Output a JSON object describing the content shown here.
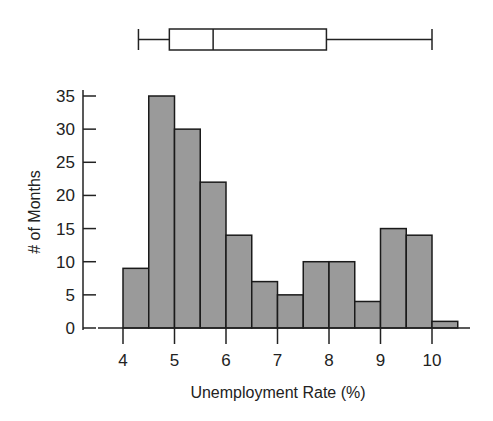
{
  "chart_data": {
    "type": "bar",
    "subtype": "histogram_with_boxplot",
    "title": "",
    "xlabel": "Unemployment Rate (%)",
    "ylabel": "# of Months",
    "bin_width": 0.5,
    "bins": [
      {
        "start": 4.0,
        "end": 4.5,
        "count": 9
      },
      {
        "start": 4.5,
        "end": 5.0,
        "count": 35
      },
      {
        "start": 5.0,
        "end": 5.5,
        "count": 30
      },
      {
        "start": 5.5,
        "end": 6.0,
        "count": 22
      },
      {
        "start": 6.0,
        "end": 6.5,
        "count": 14
      },
      {
        "start": 6.5,
        "end": 7.0,
        "count": 7
      },
      {
        "start": 7.0,
        "end": 7.5,
        "count": 5
      },
      {
        "start": 7.5,
        "end": 8.0,
        "count": 10
      },
      {
        "start": 8.0,
        "end": 8.5,
        "count": 10
      },
      {
        "start": 8.5,
        "end": 9.0,
        "count": 4
      },
      {
        "start": 9.0,
        "end": 9.5,
        "count": 15
      },
      {
        "start": 9.5,
        "end": 10.0,
        "count": 14
      },
      {
        "start": 10.0,
        "end": 10.5,
        "count": 1
      }
    ],
    "categories": [
      "4.0-4.5",
      "4.5-5.0",
      "5.0-5.5",
      "5.5-6.0",
      "6.0-6.5",
      "6.5-7.0",
      "7.0-7.5",
      "7.5-8.0",
      "8.0-8.5",
      "8.5-9.0",
      "9.0-9.5",
      "9.5-10.0",
      "10.0-10.5"
    ],
    "values": [
      9,
      35,
      30,
      22,
      14,
      7,
      5,
      10,
      10,
      4,
      15,
      14,
      1
    ],
    "xticks": [
      4,
      5,
      6,
      7,
      8,
      9,
      10
    ],
    "yticks": [
      0,
      5,
      10,
      15,
      20,
      25,
      30,
      35
    ],
    "xlim": [
      3.5,
      10.8
    ],
    "ylim": [
      0,
      35
    ],
    "grid": false,
    "legend": null,
    "boxplot": {
      "min": 4.3,
      "q1": 4.9,
      "median": 5.75,
      "q3": 7.95,
      "max": 10.0
    },
    "colors": {
      "bar_fill": "#9a9a9a",
      "bar_stroke": "#1a1a1a",
      "axis": "#222222"
    }
  }
}
